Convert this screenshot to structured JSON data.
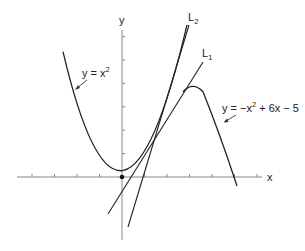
{
  "figure": {
    "axis_labels": {
      "x": "x",
      "y": "y"
    },
    "curves": [
      {
        "name": "parabola-upward",
        "equation": "y = x²",
        "label_main": "y = x",
        "label_sup": "2"
      },
      {
        "name": "parabola-downward",
        "equation": "y = −x² + 6x − 5",
        "label_main": "y = −x",
        "label_sup": "2",
        "label_rest": " + 6x − 5"
      }
    ],
    "lines": [
      {
        "name": "L1",
        "label_main": "L",
        "label_sub": "1",
        "equation": "y = 2x − 1"
      },
      {
        "name": "L2",
        "label_main": "L",
        "label_sub": "2",
        "equation": "y = 4x − 4"
      }
    ],
    "origin_point": {
      "x": 0,
      "y": 0
    },
    "x_ticks": [
      -4,
      -3,
      -2,
      -1,
      1,
      2,
      3,
      4,
      5,
      6
    ],
    "y_ticks": [
      1,
      2,
      3,
      4,
      5,
      6
    ],
    "colors": {
      "curve": "#222222",
      "axis": "#888888",
      "background": "#ffffff"
    }
  }
}
